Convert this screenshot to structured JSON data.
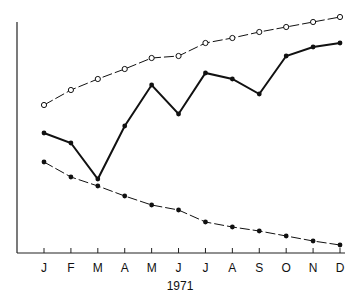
{
  "chart_data": {
    "type": "line",
    "title": "",
    "xlabel": "1971",
    "ylabel": "",
    "categories": [
      "J",
      "F",
      "M",
      "A",
      "M",
      "J",
      "J",
      "A",
      "S",
      "O",
      "N",
      "D"
    ],
    "ylim": [
      0,
      231
    ],
    "grid": false,
    "legend": null,
    "series": [
      {
        "name": "open-circle series",
        "style": "dashed-thin",
        "marker": "open-circle",
        "values": [
          148,
          163,
          174,
          184,
          195,
          197,
          210,
          215,
          221,
          226,
          231,
          236
        ]
      },
      {
        "name": "solid series",
        "style": "solid-thick",
        "marker": "filled-dot",
        "values": [
          120,
          110,
          74,
          127,
          168,
          139,
          180,
          174,
          159,
          197,
          206,
          210
        ]
      },
      {
        "name": "filled-dot dashed series",
        "style": "dashed-thin",
        "marker": "filled-dot",
        "values": [
          91,
          76,
          67,
          57,
          48,
          43,
          31,
          26,
          22,
          17,
          12,
          8
        ]
      }
    ],
    "note": "Y axis has no tick labels; values are relative units (pixels above the x-axis)."
  }
}
